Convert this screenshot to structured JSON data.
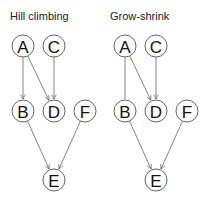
{
  "panels": [
    {
      "title": "Hill climbing",
      "nodes": [
        {
          "id": "A",
          "x": 23,
          "y": 46
        },
        {
          "id": "C",
          "x": 54,
          "y": 46
        },
        {
          "id": "B",
          "x": 23,
          "y": 111
        },
        {
          "id": "D",
          "x": 54,
          "y": 111
        },
        {
          "id": "F",
          "x": 85,
          "y": 111
        },
        {
          "id": "E",
          "x": 54,
          "y": 180
        }
      ],
      "edges": [
        {
          "from": "A",
          "to": "B",
          "directed": true
        },
        {
          "from": "A",
          "to": "D",
          "directed": true
        },
        {
          "from": "C",
          "to": "D",
          "directed": true
        },
        {
          "from": "B",
          "to": "E",
          "directed": true
        },
        {
          "from": "F",
          "to": "E",
          "directed": true
        }
      ]
    },
    {
      "title": "Grow-shrink",
      "nodes": [
        {
          "id": "A",
          "x": 125,
          "y": 46
        },
        {
          "id": "C",
          "x": 156,
          "y": 46
        },
        {
          "id": "B",
          "x": 125,
          "y": 111
        },
        {
          "id": "D",
          "x": 156,
          "y": 111
        },
        {
          "id": "F",
          "x": 187,
          "y": 111
        },
        {
          "id": "E",
          "x": 156,
          "y": 180
        }
      ],
      "edges": [
        {
          "from": "A",
          "to": "B",
          "directed": false
        },
        {
          "from": "A",
          "to": "D",
          "directed": true
        },
        {
          "from": "C",
          "to": "D",
          "directed": true
        },
        {
          "from": "B",
          "to": "E",
          "directed": true
        },
        {
          "from": "F",
          "to": "E",
          "directed": true
        }
      ]
    }
  ],
  "style": {
    "node_radius": 11,
    "edge_color": "#666666",
    "node_stroke": "#555555"
  }
}
